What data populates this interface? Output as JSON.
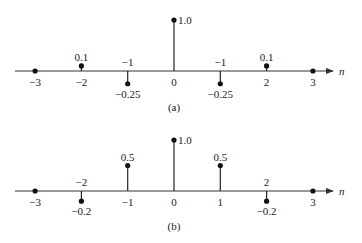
{
  "chart_data": [
    {
      "type": "stem",
      "caption": "(a)",
      "xlabel": "n",
      "ylabel": "",
      "x": [
        -3,
        -2,
        -1,
        0,
        1,
        2,
        3
      ],
      "values": [
        0,
        0.1,
        -0.25,
        1.0,
        -0.25,
        0.1,
        0
      ],
      "value_labels": [
        "",
        "0.1",
        "−0.25",
        "1.0",
        "−0.25",
        "0.1",
        ""
      ],
      "tick_labels": [
        "−3",
        "−2",
        "−1",
        "0",
        "−1",
        "2",
        "3"
      ],
      "grid": false
    },
    {
      "type": "stem",
      "caption": "(b)",
      "xlabel": "n",
      "ylabel": "",
      "x": [
        -3,
        -2,
        -1,
        0,
        1,
        2,
        3
      ],
      "values": [
        0,
        -0.2,
        0.5,
        1.0,
        0.5,
        -0.2,
        0
      ],
      "value_labels": [
        "",
        "−0.2",
        "0.5",
        "1.0",
        "0.5",
        "−0.2",
        ""
      ],
      "tick_labels": [
        "−3",
        "−2",
        "−1",
        "0",
        "1",
        "2",
        "3"
      ],
      "grid": false
    }
  ]
}
